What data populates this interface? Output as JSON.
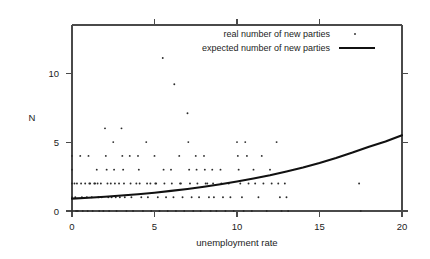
{
  "chart_data": {
    "type": "scatter",
    "title": "",
    "xlabel": "unemployment rate",
    "ylabel": "N",
    "xlim": [
      0,
      20
    ],
    "ylim": [
      0,
      13.5
    ],
    "xticks": [
      0,
      5,
      10,
      15,
      20
    ],
    "xtick_labels": [
      "0",
      "5",
      "10",
      "15",
      "20"
    ],
    "yticks": [
      0,
      5,
      10
    ],
    "ytick_labels": [
      "0",
      "5",
      "10"
    ],
    "grid": false,
    "legend_position": "top-right-inside",
    "legend": [
      {
        "label": "real number of new parties",
        "marker": "dot"
      },
      {
        "label": "expected number of new parties",
        "marker": "line"
      }
    ],
    "series": [
      {
        "name": "real number of new parties",
        "type": "scatter",
        "marker": "dot",
        "color": "#2b2b2b",
        "points": [
          [
            0.0,
            4
          ],
          [
            0.0,
            3
          ],
          [
            0.0,
            2
          ],
          [
            0.0,
            1
          ],
          [
            0.0,
            0
          ],
          [
            0.15,
            2
          ],
          [
            0.2,
            1
          ],
          [
            0.25,
            0
          ],
          [
            0.3,
            2
          ],
          [
            0.35,
            0
          ],
          [
            0.5,
            4
          ],
          [
            0.55,
            2
          ],
          [
            0.6,
            1
          ],
          [
            0.65,
            0
          ],
          [
            0.8,
            2
          ],
          [
            0.9,
            1
          ],
          [
            0.95,
            0
          ],
          [
            1.0,
            4
          ],
          [
            1.05,
            2
          ],
          [
            1.1,
            2
          ],
          [
            1.2,
            1
          ],
          [
            1.25,
            0
          ],
          [
            1.35,
            2
          ],
          [
            1.4,
            2
          ],
          [
            1.5,
            3
          ],
          [
            1.55,
            2
          ],
          [
            1.6,
            1
          ],
          [
            1.65,
            0
          ],
          [
            1.75,
            2
          ],
          [
            1.8,
            1
          ],
          [
            1.9,
            0
          ],
          [
            2.0,
            6
          ],
          [
            2.05,
            4
          ],
          [
            2.1,
            3
          ],
          [
            2.15,
            2
          ],
          [
            2.2,
            1
          ],
          [
            2.25,
            0
          ],
          [
            2.35,
            2
          ],
          [
            2.4,
            1
          ],
          [
            2.5,
            5
          ],
          [
            2.55,
            3
          ],
          [
            2.6,
            2
          ],
          [
            2.65,
            1
          ],
          [
            2.7,
            0
          ],
          [
            2.85,
            2
          ],
          [
            2.9,
            1
          ],
          [
            3.0,
            6
          ],
          [
            3.05,
            4
          ],
          [
            3.1,
            3
          ],
          [
            3.15,
            2
          ],
          [
            3.2,
            1
          ],
          [
            3.3,
            0
          ],
          [
            3.5,
            4
          ],
          [
            3.55,
            2
          ],
          [
            3.6,
            1
          ],
          [
            3.7,
            0
          ],
          [
            3.9,
            2
          ],
          [
            4.0,
            4
          ],
          [
            4.05,
            3
          ],
          [
            4.1,
            2
          ],
          [
            4.2,
            1
          ],
          [
            4.3,
            0
          ],
          [
            4.5,
            5
          ],
          [
            4.55,
            2
          ],
          [
            4.6,
            1
          ],
          [
            4.75,
            2
          ],
          [
            4.8,
            0
          ],
          [
            5.0,
            4
          ],
          [
            5.05,
            2
          ],
          [
            5.1,
            2
          ],
          [
            5.2,
            1
          ],
          [
            5.3,
            0
          ],
          [
            5.5,
            11.1
          ],
          [
            5.55,
            3
          ],
          [
            5.6,
            2
          ],
          [
            5.7,
            1
          ],
          [
            5.8,
            0
          ],
          [
            6.0,
            3
          ],
          [
            6.05,
            2
          ],
          [
            6.15,
            1
          ],
          [
            6.2,
            9.2
          ],
          [
            6.3,
            0
          ],
          [
            6.5,
            4
          ],
          [
            6.55,
            2
          ],
          [
            6.6,
            2
          ],
          [
            6.7,
            1
          ],
          [
            6.8,
            0
          ],
          [
            7.0,
            7.1
          ],
          [
            7.05,
            5
          ],
          [
            7.1,
            3
          ],
          [
            7.15,
            2
          ],
          [
            7.25,
            1
          ],
          [
            7.35,
            0
          ],
          [
            7.5,
            4
          ],
          [
            7.55,
            3
          ],
          [
            7.6,
            2
          ],
          [
            7.7,
            1
          ],
          [
            7.8,
            0
          ],
          [
            8.0,
            4
          ],
          [
            8.05,
            3
          ],
          [
            8.1,
            2
          ],
          [
            8.2,
            2
          ],
          [
            8.3,
            1
          ],
          [
            8.4,
            0
          ],
          [
            8.5,
            3
          ],
          [
            8.55,
            2
          ],
          [
            8.6,
            1
          ],
          [
            8.75,
            0
          ],
          [
            9.0,
            3
          ],
          [
            9.05,
            2
          ],
          [
            9.15,
            1
          ],
          [
            9.3,
            0
          ],
          [
            9.5,
            2
          ],
          [
            9.6,
            1
          ],
          [
            9.8,
            0
          ],
          [
            10.0,
            5
          ],
          [
            10.05,
            4
          ],
          [
            10.1,
            3
          ],
          [
            10.2,
            2
          ],
          [
            10.3,
            1
          ],
          [
            10.4,
            0
          ],
          [
            10.5,
            5
          ],
          [
            10.6,
            4
          ],
          [
            10.7,
            2
          ],
          [
            10.9,
            0
          ],
          [
            11.0,
            3
          ],
          [
            11.1,
            2
          ],
          [
            11.3,
            1
          ],
          [
            11.5,
            4
          ],
          [
            11.6,
            2
          ],
          [
            11.8,
            0
          ],
          [
            12.0,
            3
          ],
          [
            12.1,
            2
          ],
          [
            12.4,
            5
          ],
          [
            12.5,
            2
          ],
          [
            12.6,
            1
          ],
          [
            12.7,
            0
          ],
          [
            12.9,
            2
          ],
          [
            13.0,
            1
          ],
          [
            13.1,
            0
          ],
          [
            17.4,
            2
          ],
          [
            17.5,
            0
          ]
        ]
      },
      {
        "name": "expected number of new parties",
        "type": "line",
        "color": "#111111",
        "x": [
          0,
          1,
          2,
          3,
          4,
          5,
          6,
          7,
          8,
          9,
          10,
          11,
          12,
          13,
          14,
          15,
          16,
          17,
          18,
          19,
          20
        ],
        "values": [
          0.9,
          0.96,
          1.03,
          1.12,
          1.22,
          1.33,
          1.46,
          1.6,
          1.76,
          1.94,
          2.14,
          2.36,
          2.6,
          2.87,
          3.16,
          3.49,
          3.85,
          4.24,
          4.67,
          5.05,
          5.5
        ]
      }
    ]
  }
}
